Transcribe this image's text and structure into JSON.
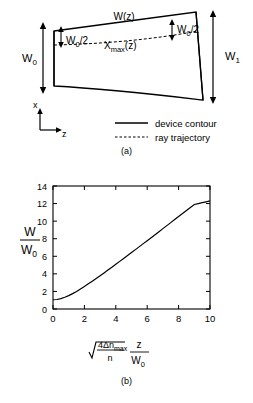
{
  "figure": {
    "panel_a": {
      "caption": "(a)",
      "labels": {
        "width_profile": "W(z)",
        "input_width": "W",
        "input_width_sub": "0",
        "output_width": "W",
        "output_width_sub": "1",
        "half_width_left": "W",
        "half_width_left_sub": "0",
        "half_width_left_div": "/2",
        "half_width_right": "W",
        "half_width_right_sub": "0",
        "half_width_right_div": "/2",
        "ray_label": "X",
        "ray_label_sub": "max",
        "ray_label_arg": "(z)",
        "axis_x": "x",
        "axis_z": "z"
      },
      "legend": [
        {
          "label": "device contour",
          "style": "solid"
        },
        {
          "label": "ray trajectory",
          "style": "dashed"
        }
      ]
    },
    "panel_b": {
      "caption": "(b)"
    }
  },
  "chart_data": {
    "type": "line",
    "title": "",
    "ylabel_num": "W",
    "ylabel_den": "W",
    "ylabel_den_sub": "0",
    "xlabel_radicand_num": "4Δn",
    "xlabel_radicand_num_sub": "max",
    "xlabel_radicand_den": "n",
    "xlabel_factor_num": "z",
    "xlabel_factor_den": "W",
    "xlabel_factor_den_sub": "0",
    "xlim": [
      0,
      10
    ],
    "ylim": [
      0,
      14
    ],
    "xticks": [
      0,
      2,
      4,
      6,
      8,
      10
    ],
    "yticks": [
      0,
      2,
      4,
      6,
      8,
      10,
      12,
      14
    ],
    "xtick_labels": [
      "0",
      "2",
      "4",
      "6",
      "8",
      "10"
    ],
    "ytick_labels": [
      "0",
      "2",
      "4",
      "6",
      "8",
      "10",
      "12",
      "14"
    ],
    "grid": false,
    "legend": null,
    "x": [
      0,
      0.25,
      0.5,
      0.75,
      1,
      1.25,
      1.5,
      1.75,
      2,
      2.25,
      2.5,
      2.75,
      3,
      3.25,
      3.5,
      3.75,
      4,
      4.25,
      4.5,
      4.75,
      5,
      5.25,
      5.5,
      5.75,
      6,
      6.25,
      6.5,
      6.75,
      7,
      7.25,
      7.5,
      7.75,
      8,
      8.25,
      8.5,
      8.75,
      9,
      9.25,
      9.5,
      9.75,
      10
    ],
    "values": [
      1.0,
      1.03,
      1.12,
      1.25,
      1.41,
      1.6,
      1.8,
      2.02,
      2.24,
      2.46,
      2.69,
      2.92,
      3.16,
      3.4,
      3.64,
      3.88,
      4.12,
      4.36,
      4.61,
      4.85,
      5.1,
      5.35,
      5.59,
      5.84,
      6.08,
      6.33,
      6.58,
      6.82,
      7.07,
      7.32,
      7.57,
      7.81,
      8.06,
      8.31,
      8.56,
      8.81,
      9.06,
      9.3,
      9.55,
      9.8,
      10.05
    ],
    "curve_note": "W/W0 = sqrt(1 + x^2) scaled so endpoint reaches 12.3",
    "display_values": [
      1.05,
      1.08,
      1.18,
      1.33,
      1.52,
      1.75,
      2.0,
      2.28,
      2.56,
      2.86,
      3.16,
      3.47,
      3.79,
      4.11,
      4.43,
      4.76,
      5.09,
      5.42,
      5.75,
      6.08,
      6.42,
      6.76,
      7.1,
      7.44,
      7.78,
      8.12,
      8.46,
      8.8,
      9.15,
      9.49,
      9.83,
      10.18,
      10.52,
      10.87,
      11.21,
      11.56,
      11.9,
      12.0,
      12.1,
      12.2,
      12.3
    ],
    "start_value": 1.05,
    "end_value": 12.3
  }
}
